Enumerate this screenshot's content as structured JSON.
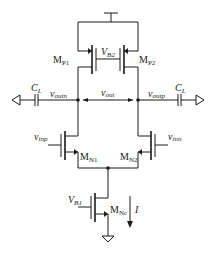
{
  "diagram": {
    "type": "circuit-schematic",
    "title": "",
    "transistors": [
      {
        "id": "MP1",
        "label": "M",
        "sub": "P1",
        "type": "pmos"
      },
      {
        "id": "MP2",
        "label": "M",
        "sub": "P2",
        "type": "pmos"
      },
      {
        "id": "MN1",
        "label": "M",
        "sub": "N1",
        "type": "nmos"
      },
      {
        "id": "MN2",
        "label": "M",
        "sub": "N2",
        "type": "nmos"
      },
      {
        "id": "MNc",
        "label": "M",
        "sub": "Nc",
        "type": "nmos"
      }
    ],
    "labels": {
      "vb2": {
        "main": "V",
        "sub": "B2"
      },
      "vb1": {
        "main": "V",
        "sub": "B1"
      },
      "cl_left": {
        "main": "C",
        "sub": "L"
      },
      "cl_right": {
        "main": "C",
        "sub": "L"
      },
      "voutn": {
        "main": "v",
        "sub": "outn"
      },
      "voutp": {
        "main": "v",
        "sub": "outp"
      },
      "vout": {
        "main": "v",
        "sub": "out"
      },
      "vinp": {
        "main": "v",
        "sub": "inp"
      },
      "vinn": {
        "main": "v",
        "sub": "inn"
      },
      "current": "I"
    },
    "nodes": [
      "supply",
      "voutn",
      "voutp",
      "tail",
      "ground"
    ]
  }
}
